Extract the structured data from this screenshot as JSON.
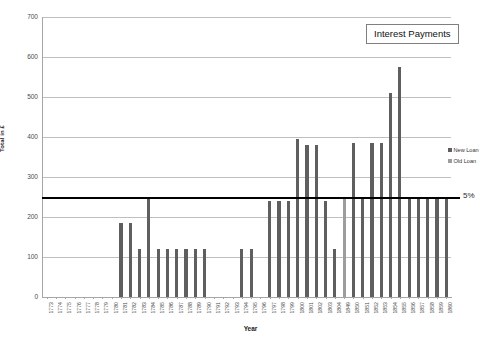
{
  "chart_data": {
    "type": "bar",
    "title": "Interest Payments",
    "xlabel": "Year",
    "ylabel": "Total in £",
    "ylim": [
      0,
      700
    ],
    "ytick_values": [
      0,
      100,
      200,
      300,
      400,
      500,
      600,
      700
    ],
    "ytick_labels": [
      "0",
      "100",
      "200",
      "300",
      "400",
      "500",
      "600",
      "700"
    ],
    "grid": true,
    "legend_position": "right",
    "legend": [
      "New Loan",
      "Old Loan"
    ],
    "colors": {
      "new_loan": "#5f5f5f",
      "old_loan": "#9d9d9d",
      "reference_line": "#000000",
      "gridline": "#bfbfbf"
    },
    "annotations": [
      {
        "label": "5%",
        "type": "reference-line",
        "value": 250
      }
    ],
    "categories": [
      "1773",
      "1774",
      "1775",
      "1776",
      "1777",
      "1778",
      "1779",
      "1780",
      "1781",
      "1782",
      "1783",
      "1784",
      "1785",
      "1786",
      "1787",
      "1788",
      "1789",
      "1790",
      "1791",
      "1792",
      "1793",
      "1794",
      "1795",
      "1796",
      "1797",
      "1798",
      "1799",
      "1800",
      "1801",
      "1802",
      "1803",
      "1804",
      "1849",
      "1850",
      "1851",
      "1852",
      "1853",
      "1854",
      "1855",
      "1856",
      "1857",
      "1858",
      "1859",
      "1860"
    ],
    "series": [
      {
        "name": "New Loan",
        "values": [
          0,
          0,
          0,
          0,
          0,
          0,
          0,
          0,
          185,
          185,
          120,
          250,
          120,
          120,
          120,
          120,
          120,
          120,
          0,
          0,
          0,
          120,
          120,
          0,
          240,
          240,
          240,
          395,
          380,
          380,
          240,
          120,
          0,
          385,
          250,
          385,
          385,
          510,
          575,
          250,
          250,
          250,
          250,
          250
        ]
      },
      {
        "name": "Old Loan",
        "values": [
          0,
          0,
          0,
          0,
          0,
          0,
          0,
          0,
          0,
          0,
          0,
          0,
          0,
          0,
          0,
          0,
          0,
          0,
          0,
          0,
          0,
          0,
          0,
          0,
          0,
          0,
          0,
          0,
          0,
          0,
          0,
          0,
          250,
          250,
          250,
          250,
          250,
          250,
          250,
          250,
          250,
          250,
          250,
          250
        ]
      }
    ]
  },
  "title_box": {
    "label": "Interest Payments"
  },
  "axes": {
    "x_title": "Year",
    "y_title": "Total in £"
  },
  "reference": {
    "label": "5%"
  }
}
